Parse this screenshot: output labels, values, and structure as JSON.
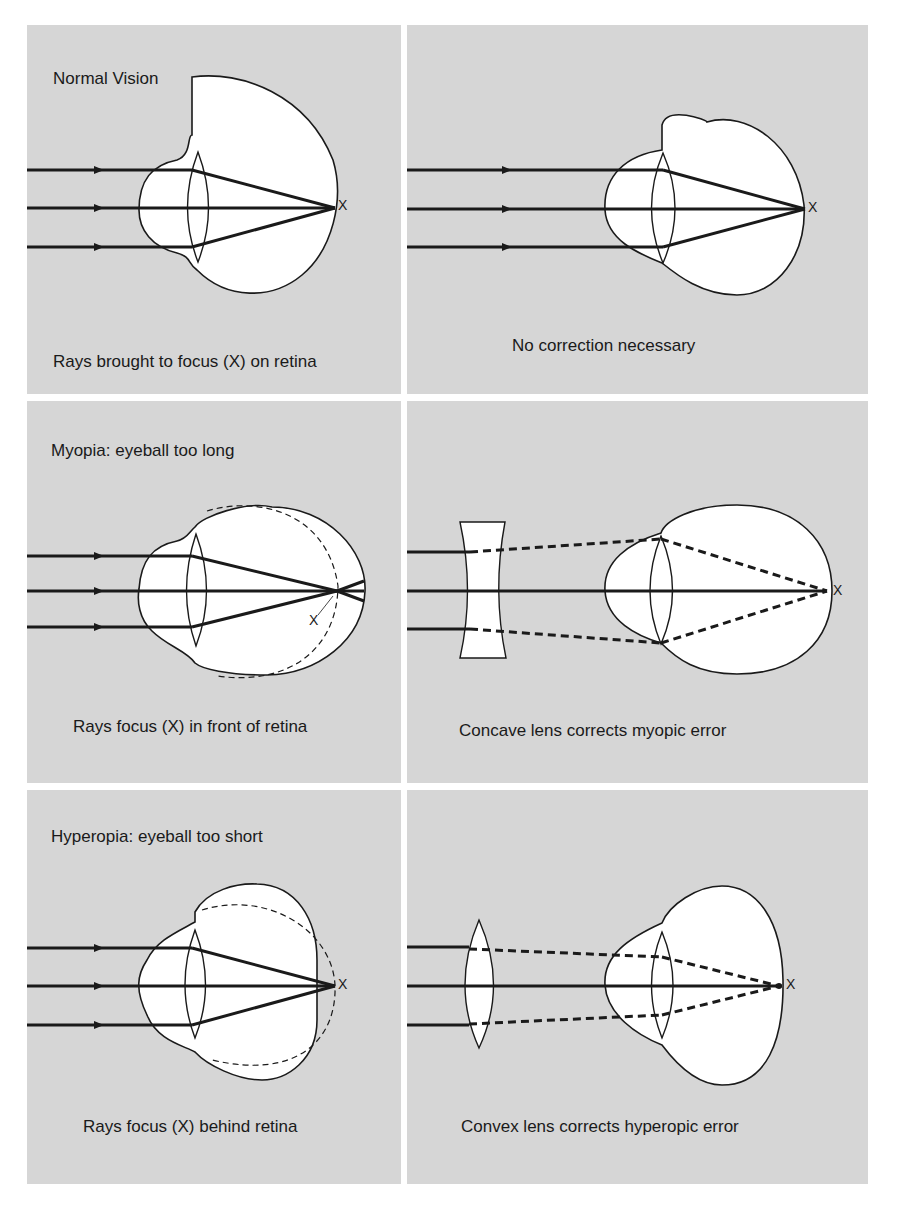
{
  "figure": {
    "background": "#d6d6d6",
    "stroke_color": "#1a1a1a",
    "eye_fill": "#ffffff"
  },
  "panels": [
    {
      "id": "normal-vision",
      "title": "Normal Vision",
      "caption": "Rays brought to focus (X) on retina",
      "focus_label": "X"
    },
    {
      "id": "normal-correction",
      "title": "",
      "caption": "No correction necessary",
      "focus_label": "X"
    },
    {
      "id": "myopia",
      "title": "Myopia: eyeball too long",
      "caption": "Rays focus (X) in front of retina",
      "focus_label": "X"
    },
    {
      "id": "myopia-correction",
      "title": "",
      "caption": "Concave lens corrects myopic error",
      "focus_label": "X"
    },
    {
      "id": "hyperopia",
      "title": "Hyperopia: eyeball too short",
      "caption": "Rays focus (X) behind retina",
      "focus_label": "X"
    },
    {
      "id": "hyperopia-correction",
      "title": "",
      "caption": "Convex lens corrects hyperopic error",
      "focus_label": "X"
    }
  ]
}
